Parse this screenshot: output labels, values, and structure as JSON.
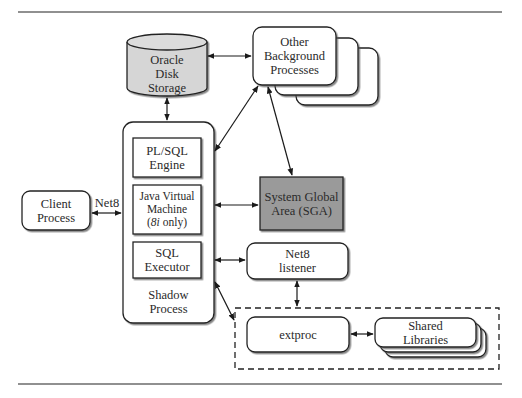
{
  "diagram": {
    "nodes": {
      "oracle_disk_storage": {
        "line1": "Oracle",
        "line2": "Disk",
        "line3": "Storage",
        "fill": "#d6d6d6"
      },
      "other_background_processes": {
        "line1": "Other",
        "line2": "Background",
        "line3": "Processes"
      },
      "client_process": {
        "line1": "Client",
        "line2": "Process"
      },
      "shadow_process": {
        "line1": "Shadow",
        "line2": "Process"
      },
      "plsql_engine": {
        "line1": "PL/SQL",
        "line2": "Engine"
      },
      "jvm": {
        "line1": "Java Virtual",
        "line2": "Machine",
        "line3_prefix": "(",
        "line3_italic": "8i",
        "line3_suffix": " only)"
      },
      "sql_executor": {
        "line1": "SQL",
        "line2": "Executor"
      },
      "sga": {
        "line1": "System Global",
        "line2": "Area (SGA)",
        "fill": "#9a9a9a"
      },
      "net8_listener": {
        "line1": "Net8",
        "line2": "listener"
      },
      "extproc": {
        "line1": "extproc"
      },
      "shared_libraries": {
        "line1": "Shared",
        "line2": "Libraries"
      }
    },
    "edges": [
      {
        "from": "oracle_disk_storage",
        "to": "other_background_processes",
        "type": "bidirectional"
      },
      {
        "from": "oracle_disk_storage",
        "to": "shadow_process",
        "type": "bidirectional"
      },
      {
        "from": "shadow_process",
        "to": "other_background_processes",
        "type": "bidirectional"
      },
      {
        "from": "other_background_processes",
        "to": "sga",
        "type": "bidirectional"
      },
      {
        "from": "client_process",
        "to": "shadow_process",
        "type": "bidirectional",
        "label": "Net8"
      },
      {
        "from": "shadow_process",
        "to": "sga",
        "type": "bidirectional"
      },
      {
        "from": "shadow_process",
        "to": "net8_listener",
        "type": "bidirectional"
      },
      {
        "from": "net8_listener",
        "to": "extproc_group",
        "type": "bidirectional"
      },
      {
        "from": "shadow_process",
        "to": "extproc_group",
        "type": "bidirectional"
      },
      {
        "from": "extproc",
        "to": "shared_libraries",
        "type": "bidirectional"
      }
    ],
    "edge_label_net8": "Net8"
  }
}
